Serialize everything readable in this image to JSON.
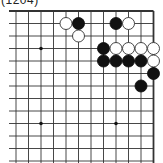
{
  "diagram": {
    "label": "(1204)",
    "board": {
      "corner": "top-right",
      "columns_x": [
        16,
        28.5,
        41,
        53.5,
        66,
        78.5,
        91,
        103.5,
        116,
        128.5,
        141,
        153.5
      ],
      "rows_y": [
        11,
        23.5,
        36,
        48.5,
        61,
        73.5,
        86,
        98.5,
        111,
        123.5,
        136,
        148.5,
        161
      ],
      "left_extent": 9,
      "bottom_extent": 163,
      "line_color": "#333333",
      "edge_width": 1.8,
      "line_width": 0.9
    },
    "hoshi": [
      {
        "col": 2,
        "row": 3
      },
      {
        "col": 2,
        "row": 9
      },
      {
        "col": 8,
        "row": 9
      }
    ],
    "stones": [
      {
        "color": "white",
        "col": 4,
        "row": 1
      },
      {
        "color": "black",
        "col": 5,
        "row": 1
      },
      {
        "color": "white",
        "col": 5,
        "row": 2
      },
      {
        "color": "black",
        "col": 8,
        "row": 1
      },
      {
        "color": "white",
        "col": 9,
        "row": 1
      },
      {
        "color": "black",
        "col": 7,
        "row": 3
      },
      {
        "color": "white",
        "col": 8,
        "row": 3
      },
      {
        "color": "white",
        "col": 9,
        "row": 3
      },
      {
        "color": "white",
        "col": 10,
        "row": 3
      },
      {
        "color": "white",
        "col": 11,
        "row": 3
      },
      {
        "color": "black",
        "col": 7,
        "row": 4
      },
      {
        "color": "black",
        "col": 8,
        "row": 4
      },
      {
        "color": "black",
        "col": 9,
        "row": 4
      },
      {
        "color": "black",
        "col": 10,
        "row": 4
      },
      {
        "color": "white",
        "col": 11,
        "row": 4
      },
      {
        "color": "black",
        "col": 11,
        "row": 5
      },
      {
        "color": "black",
        "col": 10,
        "row": 6
      }
    ],
    "colors": {
      "black_stone": "#111111",
      "white_stone_fill": "#ffffff",
      "white_stone_stroke": "#333333"
    }
  }
}
